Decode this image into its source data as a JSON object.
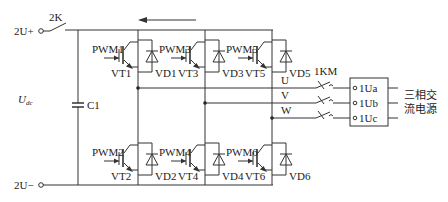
{
  "diagram": {
    "dc_bus": {
      "positive_terminal": "2U+",
      "negative_terminal": "2U−",
      "voltage_label": "U",
      "voltage_subscript": "dc",
      "switch_label": "2K",
      "capacitor_label": "C1",
      "current_arrow_direction": "left"
    },
    "upper_switches": [
      {
        "gate": "PWM1",
        "transistor": "VT1",
        "diode": "VD1"
      },
      {
        "gate": "PWM3",
        "transistor": "VT3",
        "diode": "VD3"
      },
      {
        "gate": "PWM5",
        "transistor": "VT5",
        "diode": "VD5"
      }
    ],
    "lower_switches": [
      {
        "gate": "PWM2",
        "transistor": "VT2",
        "diode": "VD2"
      },
      {
        "gate": "PWM4",
        "transistor": "VT4",
        "diode": "VD4"
      },
      {
        "gate": "PWM6",
        "transistor": "VT6",
        "diode": "VD6"
      }
    ],
    "phases": [
      "U",
      "V",
      "W"
    ],
    "contactor_label": "1KM",
    "output_terminals": [
      "1Ua",
      "1Ub",
      "1Uc"
    ],
    "source_label_line1": "三相交",
    "source_label_line2": "流电源"
  }
}
